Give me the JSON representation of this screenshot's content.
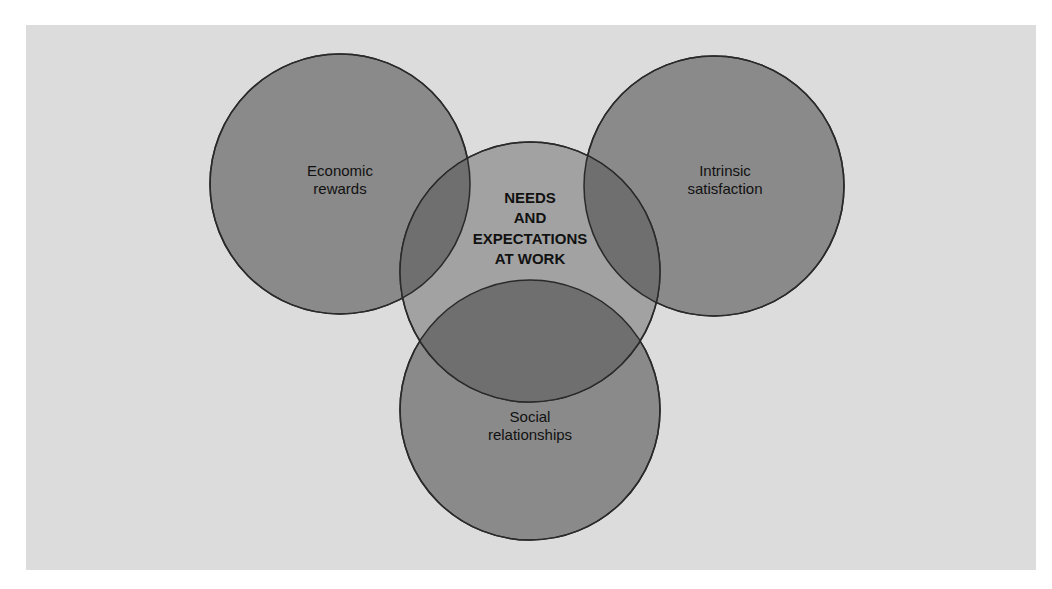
{
  "diagram": {
    "title": "NEEDS AND EXPECTATIONS AT WORK",
    "center": {
      "lines": [
        "NEEDS",
        "AND",
        "EXPECTATIONS",
        "AT WORK"
      ]
    },
    "circles": [
      {
        "id": "economic",
        "lines": [
          "Economic",
          "rewards"
        ]
      },
      {
        "id": "intrinsic",
        "lines": [
          "Intrinsic",
          "satisfaction"
        ]
      },
      {
        "id": "social",
        "lines": [
          "Social",
          "relationships"
        ]
      }
    ],
    "colors": {
      "background": "#dcdcdc",
      "outer_circle_fill": "#8a8a8a",
      "center_circle_fill": "#a2a2a2",
      "overlap_fill": "#6f6f6f",
      "stroke": "#2a2a2a"
    }
  }
}
